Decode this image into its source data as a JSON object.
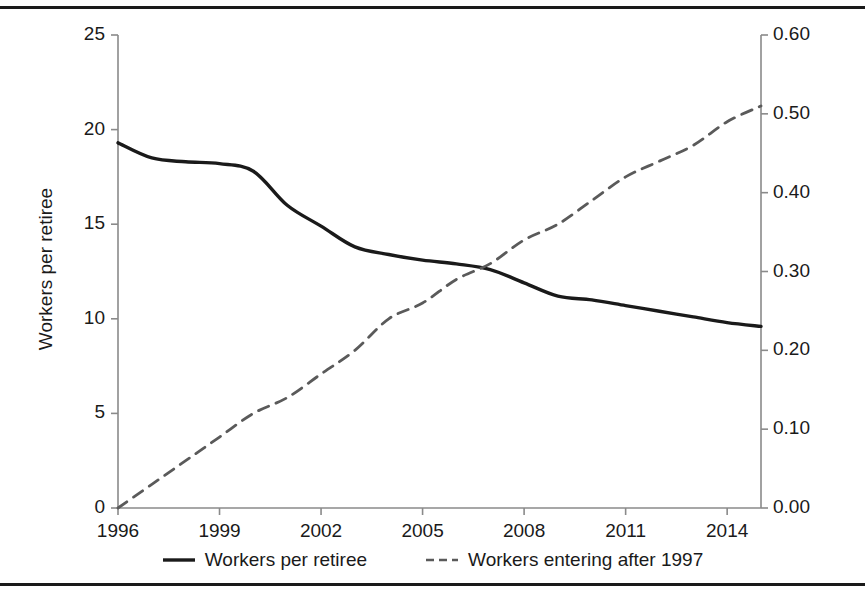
{
  "figure": {
    "left_axis_title": "Workers per retiree",
    "right_axis_title": "Share of workers who entered after 1997",
    "caption": ""
  },
  "legend": {
    "position": "bottom-center",
    "entries": [
      {
        "label": "Workers per retiree",
        "style": "solid",
        "color": "#1a1a1a"
      },
      {
        "label": "Workers entering after 1997",
        "style": "dashed",
        "color": "#5a5a5a"
      }
    ]
  },
  "axes": {
    "x_ticks": [
      "1996",
      "1999",
      "2002",
      "2005",
      "2008",
      "2011",
      "2014"
    ],
    "y_left_ticks": [
      "0",
      "5",
      "10",
      "15",
      "20",
      "25"
    ],
    "y_right_ticks": [
      "0.00",
      "0.10",
      "0.20",
      "0.30",
      "0.40",
      "0.50",
      "0.60"
    ]
  },
  "colors": {
    "solid_series": "#1a1a1a",
    "dashed_series": "#5a5a5a",
    "axis": "#8a8a8a",
    "rule": "#1a1a1a",
    "background": "#ffffff"
  },
  "chart_data": {
    "type": "line",
    "title": "",
    "xlabel": "",
    "ylabel": "Workers per retiree",
    "y2label": "Share of workers who entered after 1997",
    "grid": false,
    "legend_position": "bottom-center",
    "xlim": [
      1996,
      2015
    ],
    "ylim": [
      0,
      25
    ],
    "y2lim": [
      0.0,
      0.6
    ],
    "x_tick_values": [
      1996,
      1999,
      2002,
      2005,
      2008,
      2011,
      2014
    ],
    "y_tick_values": [
      0,
      5,
      10,
      15,
      20,
      25
    ],
    "y2_tick_values": [
      0.0,
      0.1,
      0.2,
      0.3,
      0.4,
      0.5,
      0.6
    ],
    "x": [
      1996,
      1997,
      1998,
      1999,
      2000,
      2001,
      2002,
      2003,
      2004,
      2005,
      2006,
      2007,
      2008,
      2009,
      2010,
      2011,
      2012,
      2013,
      2014,
      2015
    ],
    "series": [
      {
        "name": "Workers per retiree",
        "axis": "left",
        "style": "solid",
        "color": "#1a1a1a",
        "values": [
          19.3,
          18.5,
          18.3,
          18.2,
          17.8,
          16.0,
          14.9,
          13.8,
          13.4,
          13.1,
          12.9,
          12.6,
          11.9,
          11.2,
          11.0,
          10.7,
          10.4,
          10.1,
          9.8,
          9.6
        ]
      },
      {
        "name": "Workers entering after 1997",
        "axis": "right",
        "style": "dashed",
        "color": "#5a5a5a",
        "values": [
          0.0,
          0.03,
          0.06,
          0.09,
          0.12,
          0.14,
          0.17,
          0.2,
          0.24,
          0.26,
          0.29,
          0.31,
          0.34,
          0.36,
          0.39,
          0.42,
          0.44,
          0.46,
          0.49,
          0.51
        ]
      }
    ]
  }
}
